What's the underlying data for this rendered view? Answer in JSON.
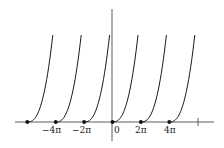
{
  "chart_data": {
    "type": "line",
    "title": "",
    "xlabel": "",
    "ylabel": "",
    "grid": false,
    "legend": null,
    "x_tick_labels": [
      "−4π",
      "−2π",
      "0",
      "2π",
      "4π"
    ],
    "x_tick_values": [
      -12.566,
      -6.283,
      0,
      6.283,
      12.566
    ],
    "unlabeled_ticks": [
      18.85
    ],
    "marked_points": [
      {
        "x": "-6π",
        "y": 0
      },
      {
        "x": "-4π",
        "y": 0
      },
      {
        "x": "-2π",
        "y": 0
      },
      {
        "x": "0",
        "y": 0
      },
      {
        "x": "2π",
        "y": 0
      },
      {
        "x": "4π",
        "y": 0
      }
    ],
    "series": [
      {
        "name": "branch-1",
        "start_x": "-6π"
      },
      {
        "name": "branch-2",
        "start_x": "-4π"
      },
      {
        "name": "branch-3",
        "start_x": "-2π"
      },
      {
        "name": "branch-4",
        "start_x": "0"
      },
      {
        "name": "branch-5",
        "start_x": "2π"
      },
      {
        "name": "branch-6",
        "start_x": "4π"
      }
    ]
  },
  "labels": {
    "neg4pi": "−4π",
    "neg2pi": "−2π",
    "zero": "0",
    "pos2pi": "2π",
    "pos4pi": "4π"
  }
}
